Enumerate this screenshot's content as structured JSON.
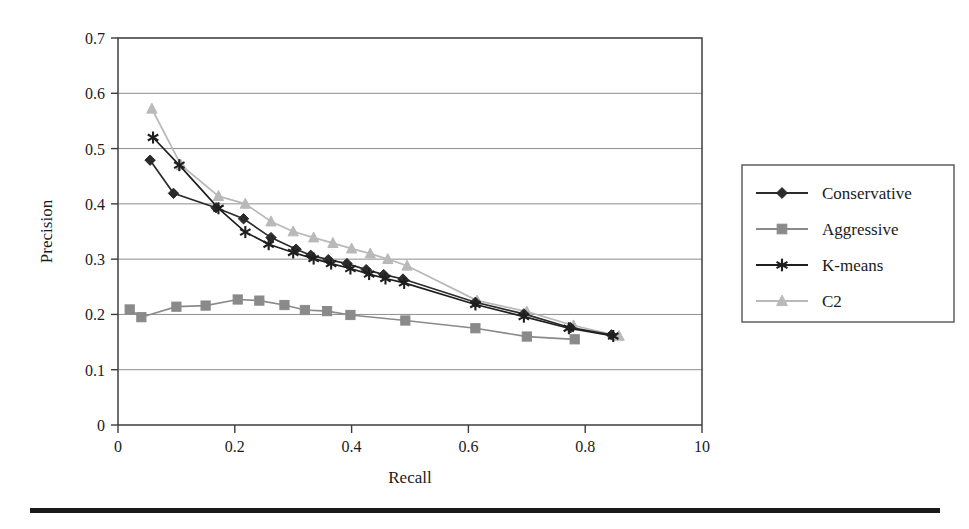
{
  "figure": {
    "background_color": "#ffffff",
    "page_rule_color": "#1a1a1a"
  },
  "chart_data": {
    "type": "line",
    "title": "",
    "xlabel": "Recall",
    "ylabel": "Precision",
    "xlim": [
      0,
      1
    ],
    "ylim": [
      0,
      0.7
    ],
    "grid": "horizontal",
    "legend_position": "right-outside",
    "x_tick_labels": [
      "0",
      "0.2",
      "0.4",
      "0.6",
      "0.8",
      "10"
    ],
    "x_tick_values": [
      0,
      0.2,
      0.4,
      0.6,
      0.8,
      1.0
    ],
    "y_tick_labels": [
      "0",
      "0.1",
      "0.2",
      "0.3",
      "0.4",
      "0.5",
      "0.6",
      "0.7"
    ],
    "y_tick_values": [
      0,
      0.1,
      0.2,
      0.3,
      0.4,
      0.5,
      0.6,
      0.7
    ],
    "series": [
      {
        "name": "Conservative",
        "color": "#2b2b2b",
        "marker": "diamond",
        "points": [
          [
            0.055,
            0.479
          ],
          [
            0.095,
            0.419
          ],
          [
            0.168,
            0.393
          ],
          [
            0.215,
            0.373
          ],
          [
            0.262,
            0.339
          ],
          [
            0.305,
            0.318
          ],
          [
            0.33,
            0.307
          ],
          [
            0.36,
            0.299
          ],
          [
            0.392,
            0.292
          ],
          [
            0.425,
            0.281
          ],
          [
            0.455,
            0.272
          ],
          [
            0.488,
            0.264
          ],
          [
            0.612,
            0.222
          ],
          [
            0.695,
            0.201
          ],
          [
            0.775,
            0.176
          ],
          [
            0.845,
            0.163
          ]
        ]
      },
      {
        "name": "Aggressive",
        "color": "#8a8a8a",
        "marker": "square",
        "points": [
          [
            0.02,
            0.209
          ],
          [
            0.04,
            0.195
          ],
          [
            0.1,
            0.214
          ],
          [
            0.15,
            0.216
          ],
          [
            0.205,
            0.227
          ],
          [
            0.242,
            0.225
          ],
          [
            0.285,
            0.217
          ],
          [
            0.32,
            0.208
          ],
          [
            0.358,
            0.206
          ],
          [
            0.398,
            0.199
          ],
          [
            0.492,
            0.189
          ],
          [
            0.612,
            0.175
          ],
          [
            0.7,
            0.16
          ],
          [
            0.782,
            0.155
          ]
        ]
      },
      {
        "name": "K-means",
        "color": "#1f1f1f",
        "marker": "asterisk",
        "points": [
          [
            0.06,
            0.52
          ],
          [
            0.105,
            0.47
          ],
          [
            0.172,
            0.392
          ],
          [
            0.218,
            0.349
          ],
          [
            0.258,
            0.327
          ],
          [
            0.3,
            0.312
          ],
          [
            0.335,
            0.301
          ],
          [
            0.365,
            0.292
          ],
          [
            0.398,
            0.283
          ],
          [
            0.43,
            0.273
          ],
          [
            0.458,
            0.265
          ],
          [
            0.49,
            0.257
          ],
          [
            0.612,
            0.218
          ],
          [
            0.695,
            0.196
          ],
          [
            0.772,
            0.175
          ],
          [
            0.848,
            0.161
          ]
        ]
      },
      {
        "name": "C2",
        "color": "#b9b9b9",
        "marker": "triangle",
        "points": [
          [
            0.058,
            0.572
          ],
          [
            0.108,
            0.47
          ],
          [
            0.172,
            0.414
          ],
          [
            0.218,
            0.4
          ],
          [
            0.262,
            0.368
          ],
          [
            0.3,
            0.35
          ],
          [
            0.335,
            0.339
          ],
          [
            0.368,
            0.329
          ],
          [
            0.4,
            0.319
          ],
          [
            0.432,
            0.31
          ],
          [
            0.462,
            0.3
          ],
          [
            0.495,
            0.288
          ],
          [
            0.615,
            0.225
          ],
          [
            0.7,
            0.205
          ],
          [
            0.78,
            0.18
          ],
          [
            0.858,
            0.161
          ]
        ]
      }
    ]
  },
  "legend": {
    "entries": [
      {
        "label": "Conservative",
        "color": "#2b2b2b",
        "marker": "diamond"
      },
      {
        "label": "Aggressive",
        "color": "#8a8a8a",
        "marker": "square"
      },
      {
        "label": "K-means",
        "color": "#1f1f1f",
        "marker": "asterisk"
      },
      {
        "label": "C2",
        "color": "#b9b9b9",
        "marker": "triangle"
      }
    ]
  }
}
